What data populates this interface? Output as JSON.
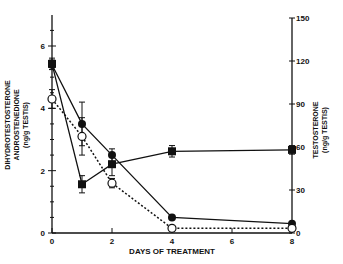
{
  "chart_data": {
    "type": "line",
    "title": "",
    "xlabel": "DAYS OF TREATMENT",
    "ylabel_left": [
      "DIHYDROTESTOSTERONE",
      "ANDROSTENEDIONE",
      "(ng/g TESTIS)"
    ],
    "ylabel_right": [
      "TESTOSTERONE",
      "(ng/g TESTIS)"
    ],
    "x_ticks": [
      "0",
      "2",
      "4",
      "6",
      "8"
    ],
    "y_left_ticks": [
      "0",
      "2",
      "4",
      "6"
    ],
    "y_right_ticks": [
      "0",
      "30",
      "60",
      "90",
      "120",
      "150"
    ],
    "xlim": [
      0,
      8
    ],
    "ylim_left": [
      0,
      7
    ],
    "ylim_right": [
      0,
      150
    ],
    "grid": false,
    "legend": "none",
    "x": [
      0,
      1,
      2,
      4,
      8
    ],
    "series": [
      {
        "name": "filled-circle (solid line)",
        "axis": "left",
        "marker": "filled-circle",
        "line": "solid",
        "values": [
          5.4,
          3.5,
          2.5,
          0.5,
          0.3
        ],
        "error": [
          0.15,
          0.7,
          0.2,
          0,
          0
        ]
      },
      {
        "name": "open-circle (dotted line)",
        "axis": "left",
        "marker": "open-circle",
        "line": "dotted",
        "values": [
          4.3,
          3.1,
          1.6,
          0.15,
          0.15
        ],
        "error": [
          0.3,
          0.6,
          0.15,
          0.05,
          0.05
        ]
      },
      {
        "name": "filled-square (solid line)",
        "axis": "right",
        "marker": "filled-square",
        "line": "solid",
        "values": [
          118,
          34,
          48,
          57,
          58
        ],
        "error": [
          4,
          6,
          8,
          4,
          3
        ]
      }
    ]
  },
  "labels": {
    "x_title": "DAYS OF TREATMENT",
    "left_title_1": "DIHYDROTESTOSTERONE",
    "left_title_2": "ANDROSTENEDIONE",
    "left_title_3": "(ng/g TESTIS)",
    "right_title_1": "TESTOSTERONE",
    "right_title_2": "(ng/g TESTIS)"
  }
}
